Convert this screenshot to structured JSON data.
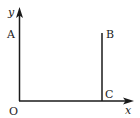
{
  "diagram": {
    "type": "coordinate-rectangle",
    "axes": {
      "x_label": "x",
      "y_label": "y",
      "origin_label": "O"
    },
    "points": {
      "A": "A",
      "B": "B",
      "C": "C"
    },
    "colors": {
      "stroke": "#1a1a1a",
      "top_edge_left": "#2a5a2a",
      "top_edge_mid": "#3c8a3c",
      "top_edge_right": "#b03a3a",
      "text": "#222222"
    }
  }
}
